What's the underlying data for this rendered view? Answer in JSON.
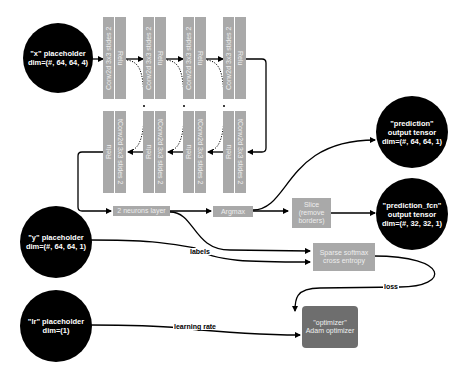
{
  "inputs": {
    "x": {
      "line1": "\"x\" placeholder",
      "line2": "dim=(#, 64, 64, 4)"
    },
    "y": {
      "line1": "\"y\" placeholder",
      "line2": "dim=(#, 64, 64, 1)"
    },
    "lr": {
      "line1": "\"lr\" placeholder",
      "line2": "dim=(1)"
    }
  },
  "outputs": {
    "prediction": {
      "line1": "\"prediction\"",
      "line2": "output tensor",
      "line3": "dim=(#, 64, 64, 1)"
    },
    "prediction_fcn": {
      "line1": "\"prediction_fcn\"",
      "line2": "output tensor",
      "line3": "dim=(#, 32, 32, 1)"
    }
  },
  "encoder": [
    {
      "conv": "Conv2d 3x3 stides 2",
      "act": "Relu"
    },
    {
      "conv": "Conv2d 3x3 stides 2",
      "act": "Relu"
    },
    {
      "conv": "Conv2d 3x3 stides 2",
      "act": "Relu"
    },
    {
      "conv": "Conv2d 3x3 stides 2",
      "act": "Relu"
    }
  ],
  "decoder": [
    {
      "conv": "tConv2d 3x3 stides 2",
      "act": "Relu"
    },
    {
      "conv": "tConv2d 3x3 stides 2",
      "act": "Relu"
    },
    {
      "conv": "tConv2d 3x3 stides 2",
      "act": "Relu"
    },
    {
      "conv": "tConv2d 3x3 stides 2",
      "act": "Relu"
    }
  ],
  "skip_marker": "+",
  "ops": {
    "neurons": "2 neurons layer",
    "argmax": "Argmax",
    "slice": {
      "line1": "Slice",
      "line2": "(remove",
      "line3": "borders)"
    },
    "loss_fn": {
      "line1": "Sparse softmax",
      "line2": "cross entropy"
    },
    "optimizer": {
      "line1": "\"optimizer\"",
      "line2": "Adam optimizer"
    }
  },
  "edge_labels": {
    "labels": "labels",
    "loss": "loss",
    "learning_rate": "learning rate"
  },
  "colors": {
    "node_fill": "#a9a9a9",
    "optimizer_fill": "#6e6e6e",
    "tensor_fill": "#000000",
    "edge": "#000000"
  }
}
